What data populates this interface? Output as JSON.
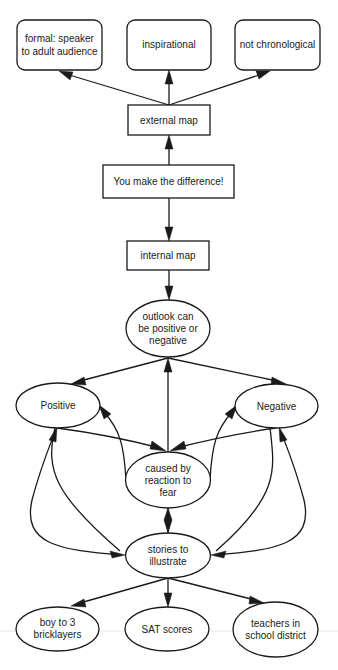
{
  "diagram": {
    "type": "concept-map",
    "nodes": {
      "formal": {
        "lines": [
          "formal: speaker",
          "to adult audience"
        ],
        "shape": "rounded-rect"
      },
      "inspirational": {
        "lines": [
          "inspirational"
        ],
        "shape": "rounded-rect"
      },
      "not_chronological": {
        "lines": [
          "not chronological"
        ],
        "shape": "rounded-rect"
      },
      "external_map": {
        "lines": [
          "external map"
        ],
        "shape": "rect"
      },
      "you_make_difference": {
        "lines": [
          "You make the difference!"
        ],
        "shape": "rect"
      },
      "internal_map": {
        "lines": [
          "internal map"
        ],
        "shape": "rect"
      },
      "outlook": {
        "lines": [
          "outlook can",
          "be positive or",
          "negative"
        ],
        "shape": "ellipse"
      },
      "positive": {
        "lines": [
          "Positive"
        ],
        "shape": "ellipse"
      },
      "negative": {
        "lines": [
          "Negative"
        ],
        "shape": "ellipse"
      },
      "caused_by": {
        "lines": [
          "caused by",
          "reaction to",
          "fear"
        ],
        "shape": "ellipse"
      },
      "stories": {
        "lines": [
          "stories to",
          "illustrate"
        ],
        "shape": "ellipse"
      },
      "boy": {
        "lines": [
          "boy to 3",
          "bricklayers"
        ],
        "shape": "ellipse"
      },
      "sat": {
        "lines": [
          "SAT scores"
        ],
        "shape": "ellipse"
      },
      "teachers": {
        "lines": [
          "teachers in",
          "school district"
        ],
        "shape": "ellipse"
      }
    },
    "edges": [
      {
        "from": "external_map",
        "to": "formal"
      },
      {
        "from": "external_map",
        "to": "inspirational"
      },
      {
        "from": "external_map",
        "to": "not_chronological"
      },
      {
        "from": "you_make_difference",
        "to": "external_map"
      },
      {
        "from": "you_make_difference",
        "to": "internal_map"
      },
      {
        "from": "internal_map",
        "to": "outlook"
      },
      {
        "from": "outlook",
        "to": "positive"
      },
      {
        "from": "outlook",
        "to": "negative"
      },
      {
        "from": "caused_by",
        "to": "outlook"
      },
      {
        "from": "positive",
        "to": "caused_by"
      },
      {
        "from": "negative",
        "to": "caused_by"
      },
      {
        "from": "caused_by",
        "to": "positive"
      },
      {
        "from": "caused_by",
        "to": "negative"
      },
      {
        "from": "stories",
        "to": "positive"
      },
      {
        "from": "positive",
        "to": "stories"
      },
      {
        "from": "stories",
        "to": "negative"
      },
      {
        "from": "negative",
        "to": "stories"
      },
      {
        "from": "caused_by",
        "to": "stories",
        "bidirectional": true
      },
      {
        "from": "stories",
        "to": "boy"
      },
      {
        "from": "stories",
        "to": "sat"
      },
      {
        "from": "stories",
        "to": "teachers"
      }
    ]
  }
}
